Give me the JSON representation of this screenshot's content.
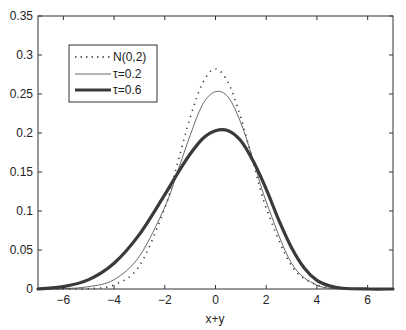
{
  "chart_data": {
    "type": "line",
    "title": "",
    "xlabel": "x+y",
    "ylabel": "",
    "xlim": [
      -7,
      7
    ],
    "ylim": [
      0,
      0.35
    ],
    "grid": false,
    "legend_position": "upper-left",
    "x_ticks": [
      -6,
      -4,
      -2,
      0,
      2,
      4,
      6
    ],
    "x_tick_labels": [
      "−6",
      "−4",
      "−2",
      "0",
      "2",
      "4",
      "6"
    ],
    "y_ticks": [
      0,
      0.05,
      0.1,
      0.15,
      0.2,
      0.25,
      0.3,
      0.35
    ],
    "y_tick_labels": [
      "0",
      "0.05",
      "0.1",
      "0.15",
      "0.2",
      "0.25",
      "0.3",
      "0.35"
    ],
    "series": [
      {
        "name": "N(0,2)",
        "style": "dotted",
        "width": 1.6,
        "color": "#333333",
        "peak": {
          "x": 0,
          "y": 0.282
        },
        "x": [
          -7,
          -6,
          -5,
          -4,
          -3,
          -2,
          -1.5,
          -1,
          -0.5,
          0,
          0.5,
          1,
          1.5,
          2,
          3,
          4,
          5,
          6,
          7
        ],
        "values": [
          0.0,
          0.0,
          0.0005,
          0.0052,
          0.0297,
          0.1038,
          0.1609,
          0.2197,
          0.2645,
          0.2821,
          0.2645,
          0.2197,
          0.1609,
          0.1038,
          0.0297,
          0.0052,
          0.0005,
          0.0,
          0.0
        ]
      },
      {
        "name": "τ=0.2",
        "style": "solid",
        "width": 0.8,
        "color": "#444444",
        "peak": {
          "x": 0.1,
          "y": 0.254
        },
        "x": [
          -7,
          -6,
          -5,
          -4,
          -3,
          -2,
          -1.5,
          -1,
          -0.5,
          0,
          0.5,
          1,
          1.5,
          2,
          3,
          4,
          5,
          6,
          7
        ],
        "values": [
          0.0,
          0.0005,
          0.003,
          0.012,
          0.042,
          0.105,
          0.15,
          0.197,
          0.237,
          0.253,
          0.246,
          0.213,
          0.164,
          0.112,
          0.033,
          0.005,
          0.0005,
          0.0,
          0.0
        ]
      },
      {
        "name": "τ=0.6",
        "style": "solid",
        "width": 3.2,
        "color": "#3a3a3a",
        "peak": {
          "x": 0.3,
          "y": 0.204
        },
        "x": [
          -7,
          -6,
          -5,
          -4,
          -3,
          -2,
          -1.5,
          -1,
          -0.5,
          0,
          0.5,
          1,
          1.5,
          2,
          2.5,
          3,
          3.5,
          4,
          4.5,
          5,
          6,
          7
        ],
        "values": [
          0.0,
          0.003,
          0.012,
          0.033,
          0.07,
          0.121,
          0.148,
          0.173,
          0.193,
          0.203,
          0.203,
          0.19,
          0.163,
          0.128,
          0.088,
          0.053,
          0.027,
          0.011,
          0.004,
          0.001,
          0.0,
          0.0
        ]
      }
    ]
  },
  "legend": {
    "items": [
      "N(0,2)",
      "τ=0.2",
      "τ=0.6"
    ]
  }
}
